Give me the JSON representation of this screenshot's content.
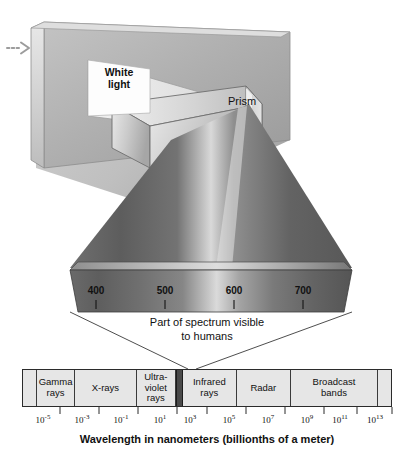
{
  "figure": {
    "background_color": "#ffffff"
  },
  "scene": {
    "white_light_label": "White\nlight",
    "prism_label": "Prism",
    "panel_color": "#b4b4b4",
    "prism_color": "#cfcfcf",
    "beam_color": "#d8d8d8"
  },
  "visible_band": {
    "caption": "Part of spectrum visible\nto humans",
    "tick_labels": [
      "400",
      "500",
      "600",
      "700"
    ],
    "tick_positions_px": [
      96,
      165,
      234,
      303
    ],
    "units": "nanometers",
    "band_left_px": 70,
    "band_right_px": 352,
    "band_top_px": 268,
    "band_bottom_px": 312
  },
  "em_spectrum": {
    "cells": [
      {
        "label": "",
        "flex": 0.55,
        "kind": "blank"
      },
      {
        "label": "Gamma\nrays",
        "flex": 1.55,
        "kind": "band"
      },
      {
        "label": "X-rays",
        "flex": 2.55,
        "kind": "band"
      },
      {
        "label": "Ultra-\nviolet\nrays",
        "flex": 1.6,
        "kind": "band"
      },
      {
        "label": "",
        "flex": 0.22,
        "kind": "visible"
      },
      {
        "label": "Infrared\nrays",
        "flex": 2.2,
        "kind": "band"
      },
      {
        "label": "Radar",
        "flex": 2.25,
        "kind": "band"
      },
      {
        "label": "Broadcast\nbands",
        "flex": 3.6,
        "kind": "band"
      },
      {
        "label": "",
        "flex": 0.55,
        "kind": "blank"
      }
    ],
    "fill_color": "#e6e6e6",
    "visible_slice_color": "#4a4a4a",
    "border_color": "#2b2b2b"
  },
  "axis": {
    "caption": "Wavelength in nanometers (billionths of a meter)",
    "ticks": [
      {
        "base": "10",
        "exponent": "-5",
        "x_px": 43
      },
      {
        "base": "10",
        "exponent": "-3",
        "x_px": 82
      },
      {
        "base": "10",
        "exponent": "-1",
        "x_px": 121
      },
      {
        "base": "10",
        "exponent": "1",
        "x_px": 160
      },
      {
        "base": "10",
        "exponent": "3",
        "x_px": 190
      },
      {
        "base": "10",
        "exponent": "5",
        "x_px": 229
      },
      {
        "base": "10",
        "exponent": "7",
        "x_px": 268
      },
      {
        "base": "10",
        "exponent": "9",
        "x_px": 307
      },
      {
        "base": "10",
        "exponent": "11",
        "x_px": 340
      },
      {
        "base": "10",
        "exponent": "13",
        "x_px": 375
      }
    ]
  },
  "margin": {
    "arrow_icon": "dashed-arrow-right-icon"
  }
}
